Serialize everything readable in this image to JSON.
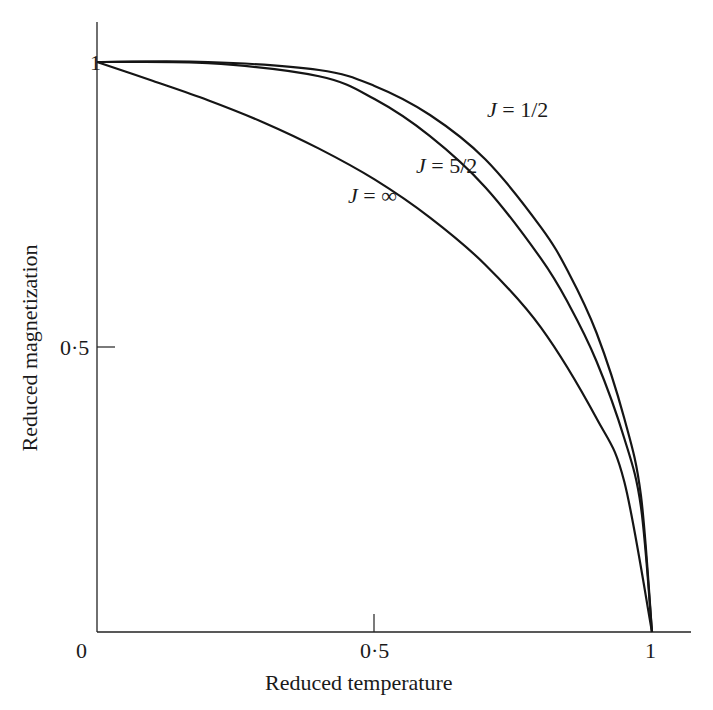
{
  "chart_data": {
    "type": "line",
    "title": "",
    "xlabel": "Reduced temperature",
    "ylabel": "Reduced magnetization",
    "xlim": [
      0,
      1.07
    ],
    "ylim": [
      0,
      1.07
    ],
    "xticks": [
      "0",
      "0·5",
      "1"
    ],
    "yticks": [
      "0·5",
      "1"
    ],
    "grid": false,
    "legend": "inline labels",
    "series": [
      {
        "name": "J = 1/2",
        "x": [
          0,
          0.2,
          0.4,
          0.5,
          0.6,
          0.7,
          0.8,
          0.85,
          0.9,
          0.95,
          0.98,
          1.0
        ],
        "y": [
          1.0,
          1.0,
          0.986,
          0.958,
          0.907,
          0.829,
          0.71,
          0.63,
          0.525,
          0.375,
          0.24,
          0.0
        ]
      },
      {
        "name": "J = 5/2",
        "x": [
          0,
          0.2,
          0.4,
          0.5,
          0.6,
          0.7,
          0.8,
          0.85,
          0.9,
          0.95,
          0.98,
          1.0
        ],
        "y": [
          1.0,
          0.998,
          0.975,
          0.935,
          0.87,
          0.78,
          0.655,
          0.575,
          0.475,
          0.34,
          0.22,
          0.0
        ]
      },
      {
        "name": "J = ∞",
        "x": [
          0,
          0.1,
          0.2,
          0.3,
          0.4,
          0.5,
          0.6,
          0.7,
          0.8,
          0.9,
          0.95,
          1.0
        ],
        "y": [
          1.0,
          0.967,
          0.933,
          0.894,
          0.848,
          0.794,
          0.727,
          0.644,
          0.534,
          0.375,
          0.264,
          0.0
        ]
      }
    ]
  },
  "labels": {
    "xlabel": "Reduced temperature",
    "ylabel": "Reduced magnetization",
    "x0": "0",
    "x05": "0·5",
    "x1": "1",
    "y05": "0·5",
    "y1": "1",
    "j_half_J": "J",
    "j_half_rest": " = 1/2",
    "j_52_J": "J",
    "j_52_rest": " = 5/2",
    "j_inf_J": "J",
    "j_inf_rest": " = ∞"
  }
}
